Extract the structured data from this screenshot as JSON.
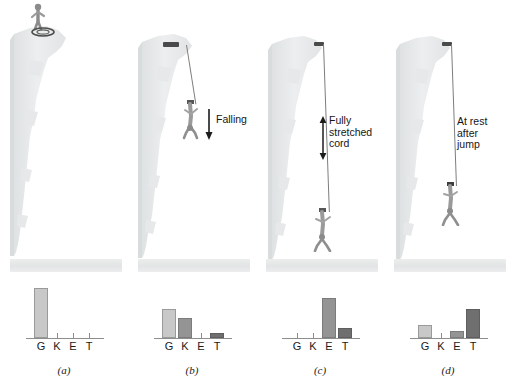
{
  "figure": {
    "ground_label": "ground",
    "colors": {
      "light_bar": "#c8c8c8",
      "mid_bar": "#949494",
      "dark_bar": "#6f6f6f",
      "cliff": "#e4e6e7",
      "cord": "#7d7d7d",
      "text": "#161616"
    }
  },
  "panels": [
    {
      "letter": "(a)",
      "scene_name": "jumper-standing-on-cliff",
      "callout": "",
      "arrow": "none",
      "cord_state": "coiled",
      "chart_data": {
        "type": "bar",
        "categories": [
          "G",
          "K",
          "E",
          "T"
        ],
        "values": [
          50,
          0,
          0,
          0
        ],
        "bar_styles": [
          "light",
          "mid",
          "mid",
          "dark"
        ],
        "title": "(a)",
        "xlabel": "",
        "ylabel": "",
        "ylim": [
          0,
          58
        ],
        "grid": false,
        "legend": "none"
      }
    },
    {
      "letter": "(b)",
      "scene_name": "jumper-falling",
      "callout": "Falling",
      "arrow": "down",
      "cord_state": "slack",
      "chart_data": {
        "type": "bar",
        "categories": [
          "G",
          "K",
          "E",
          "T"
        ],
        "values": [
          29,
          20,
          0,
          5
        ],
        "bar_styles": [
          "light",
          "mid",
          "mid",
          "dark"
        ],
        "title": "(b)",
        "xlabel": "",
        "ylabel": "",
        "ylim": [
          0,
          58
        ],
        "grid": false,
        "legend": "none"
      }
    },
    {
      "letter": "(c)",
      "scene_name": "jumper-at-lowest-point",
      "callout": "Fully\nstretched\ncord",
      "arrow": "double-vertical",
      "cord_state": "fully-stretched",
      "chart_data": {
        "type": "bar",
        "categories": [
          "G",
          "K",
          "E",
          "T"
        ],
        "values": [
          0,
          0,
          40,
          10
        ],
        "bar_styles": [
          "light",
          "mid",
          "mid",
          "dark"
        ],
        "title": "(c)",
        "xlabel": "",
        "ylabel": "",
        "ylim": [
          0,
          58
        ],
        "grid": false,
        "legend": "none"
      }
    },
    {
      "letter": "(d)",
      "scene_name": "jumper-at-rest",
      "callout": "At rest\nafter\njump",
      "arrow": "none",
      "cord_state": "stretched-at-rest",
      "chart_data": {
        "type": "bar",
        "categories": [
          "G",
          "K",
          "E",
          "T"
        ],
        "values": [
          13,
          0,
          7,
          29
        ],
        "bar_styles": [
          "light",
          "mid",
          "mid",
          "dark"
        ],
        "title": "(d)",
        "xlabel": "",
        "ylabel": "",
        "ylim": [
          0,
          58
        ],
        "grid": false,
        "legend": "none"
      }
    }
  ]
}
